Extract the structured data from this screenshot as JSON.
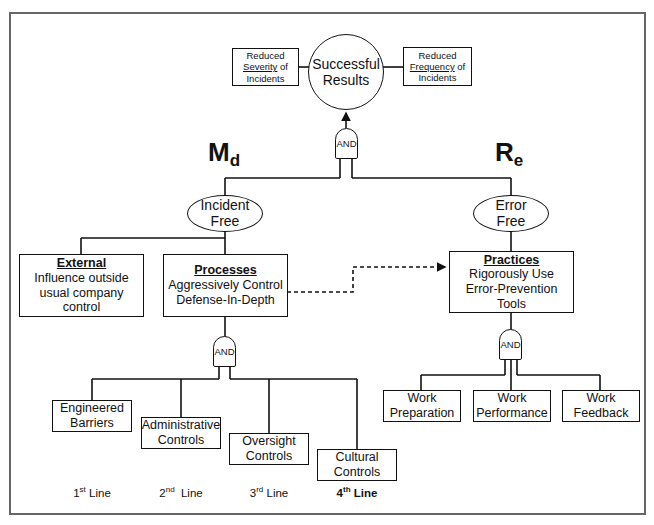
{
  "top": {
    "outcome": {
      "line1": "Successful",
      "line2": "Results"
    },
    "severity_box": {
      "line1": "Reduced",
      "line2_underlined": "Severity",
      "line2_rest": " of",
      "line3": "Incidents"
    },
    "frequency_box": {
      "line1": "Reduced",
      "line2_underlined": "Frequency",
      "line2_rest": " of",
      "line3": "Incidents"
    },
    "gate_label": "AND"
  },
  "symbols": {
    "md": {
      "main": "M",
      "sub": "d"
    },
    "re": {
      "main": "R",
      "sub": "e"
    }
  },
  "left_branch": {
    "goal": {
      "line1": "Incident",
      "line2": "Free"
    },
    "external": {
      "title": "External",
      "line1": "Influence outside",
      "line2": "usual company control"
    },
    "processes": {
      "title": "Processes",
      "line1": "Aggressively Control",
      "line2": "Defense-In-Depth"
    },
    "gate_label": "AND",
    "controls": [
      {
        "line1": "Engineered",
        "line2": "Barriers"
      },
      {
        "line1": "Administrative",
        "line2": "Controls"
      },
      {
        "line1": "Oversight",
        "line2": "Controls"
      },
      {
        "line1": "Cultural",
        "line2": "Controls"
      }
    ],
    "line_labels": [
      {
        "num": "1",
        "sup": "st",
        "text": " Line"
      },
      {
        "num": "2",
        "sup": "nd",
        "text": "  Line"
      },
      {
        "num": "3",
        "sup": "rd",
        "text": " Line"
      },
      {
        "num": "4",
        "sup": "th",
        "text": " Line"
      }
    ]
  },
  "right_branch": {
    "goal": {
      "line1": "Error",
      "line2": "Free"
    },
    "practices": {
      "title": "Practices",
      "line1": "Rigorously Use",
      "line2": "Error-Prevention Tools"
    },
    "gate_label": "AND",
    "work": [
      {
        "line1": "Work",
        "line2": "Preparation"
      },
      {
        "line1": "Work",
        "line2": "Performance"
      },
      {
        "line1": "Work",
        "line2": "Feedback"
      }
    ]
  },
  "colors": {
    "stroke": "#111111",
    "frame": "#666666",
    "background": "#ffffff"
  }
}
